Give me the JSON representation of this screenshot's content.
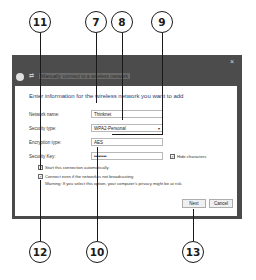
{
  "callouts": {
    "top": [
      {
        "num": "11"
      },
      {
        "num": "7"
      },
      {
        "num": "8"
      },
      {
        "num": "9"
      }
    ],
    "bottom": [
      {
        "num": "12"
      },
      {
        "num": "10"
      },
      {
        "num": "13"
      }
    ]
  },
  "dialog": {
    "title": "Manually connect to a wireless network",
    "close_glyph": "×",
    "heading": "Enter information for the wireless network you want to add",
    "fields": {
      "network_name": {
        "label": "Network name:",
        "value": "Thinknet"
      },
      "security_type": {
        "label": "Security type:",
        "value": "WPA2-Personal"
      },
      "encryption_type": {
        "label": "Encryption type:",
        "value": "AES"
      },
      "security_key": {
        "label": "Security Key:",
        "value": "••••••••"
      }
    },
    "hide_characters": {
      "label": "Hide characters",
      "checked": true
    },
    "start_automatically": {
      "label": "Start this connection automatically",
      "checked": true
    },
    "connect_not_broadcasting": {
      "label": "Connect even if the network is not broadcasting",
      "checked": true
    },
    "warning": "Warning: If you select this option, your computer's privacy might be at risk.",
    "buttons": {
      "next": "Next",
      "cancel": "Cancel"
    }
  }
}
